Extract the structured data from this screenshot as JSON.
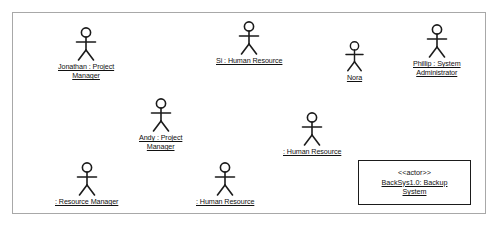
{
  "diagram": {
    "type": "uml-actor-diagram",
    "frame": {
      "border_color": "#a8a8a8"
    },
    "stroke_color": "#1b1b1b",
    "background": "#ffffff",
    "actors": [
      {
        "id": "jonathan",
        "icon": "stick-figure-actor-icon",
        "label_lines": [
          "Jonathan : Project",
          "Manager"
        ],
        "x": 58,
        "y": 27,
        "scale": 1.0
      },
      {
        "id": "si",
        "icon": "stick-figure-actor-icon",
        "label_lines": [
          "Si : Human Resource"
        ],
        "x": 216,
        "y": 21,
        "scale": 1.0
      },
      {
        "id": "nora",
        "icon": "stick-figure-actor-icon",
        "label_lines": [
          "Nora"
        ],
        "x": 341,
        "y": 41,
        "scale": 0.9
      },
      {
        "id": "phillip",
        "icon": "stick-figure-actor-icon",
        "label_lines": [
          "Phillip : System",
          "Administrator"
        ],
        "x": 413,
        "y": 24,
        "scale": 1.0
      },
      {
        "id": "andy",
        "icon": "stick-figure-actor-icon",
        "label_lines": [
          "Andy : Project",
          "Manager"
        ],
        "x": 139,
        "y": 98,
        "scale": 1.0
      },
      {
        "id": "human-resource-mid",
        "icon": "stick-figure-actor-icon",
        "label_lines": [
          ": Human Resource"
        ],
        "x": 283,
        "y": 112,
        "scale": 1.0
      },
      {
        "id": "resource-manager",
        "icon": "stick-figure-actor-icon",
        "label_lines": [
          ": Resource Manager"
        ],
        "x": 55,
        "y": 162,
        "scale": 1.0
      },
      {
        "id": "human-resource-bottom",
        "icon": "stick-figure-actor-icon",
        "label_lines": [
          ": Human Resource"
        ],
        "x": 196,
        "y": 162,
        "scale": 1.0
      }
    ],
    "system_box": {
      "id": "backup-system",
      "stereotype": "<<actor>>",
      "name_lines": [
        "BackSys1.0: Backup",
        "System"
      ],
      "x": 358,
      "y": 160,
      "width": 113,
      "height": 45
    }
  }
}
